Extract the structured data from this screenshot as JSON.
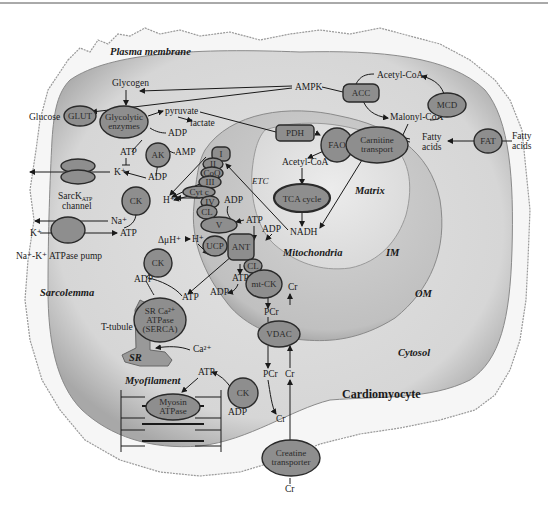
{
  "diagram": {
    "regions": {
      "plasma_membrane": "Plasma membrane",
      "sarcolemma": "Sarcolemma",
      "sr": "SR",
      "t_tubule": "T-tubule",
      "myofilament": "Myofilament",
      "mitochondria": "Mitochondria",
      "matrix": "Matrix",
      "im": "IM",
      "om": "OM",
      "cytosol": "Cytosol",
      "cell": "Cardiomyocyte",
      "etc": "ETC"
    },
    "enzymes": {
      "glut": "GLUT",
      "glycolytic_1": "Glycolytic",
      "glycolytic_2": "enzymes",
      "ak": "AK",
      "ck_top": "CK",
      "ck_mid": "CK",
      "ck_myo": "CK",
      "pdh": "PDH",
      "acc": "ACC",
      "mcd": "MCD",
      "fao": "FAO",
      "carnitine_1": "Carnitine",
      "carnitine_2": "transport",
      "fat": "FAT",
      "tca": "TCA cycle",
      "c1": "I",
      "c2": "II",
      "coq": "CoQ",
      "c3": "III",
      "cytc": "Cyt c",
      "c4": "IV",
      "cl1": "CL",
      "c5": "V",
      "ucp": "UCP",
      "ant": "ANT",
      "cl2": "CL",
      "mtck": "mt-CK",
      "vdac": "VDAC",
      "serca_1": "SR Ca²⁺",
      "serca_2": "ATPase",
      "serca_3": "(SERCA)",
      "myosin_1": "Myosin",
      "myosin_2": "ATPase",
      "creatine_1": "Creatine",
      "creatine_2": "transporter",
      "sarc_katp_1": "SarcK",
      "sarc_katp_sub": "ATP",
      "sarc_katp_2": "channel",
      "nak_pump": "Na⁺-K⁺ ATPase pump"
    },
    "metabolites": {
      "glycogen": "Glycogen",
      "glucose": "Glucose",
      "pyruvate": "pyruvate",
      "lactate": "lactate",
      "ampk": "AMPK",
      "acetyl_coa_top": "Acetyl-CoA",
      "malonyl_coa": "Malonyl-CoA",
      "fatty_acids_in": "Fatty\nacids",
      "fatty_acids_in_1": "Fatty",
      "fatty_acids_in_2": "acids",
      "fatty_acids_out_1": "Fatty",
      "fatty_acids_out_2": "acids",
      "acetyl_coa_mito": "Acetyl-CoA",
      "nadh": "NADH",
      "adp_glyco": "ADP",
      "atp_ak": "ATP",
      "amp": "AMP",
      "adp_ak": "ADP",
      "k_in": "K⁺",
      "h_plus_1": "H⁺",
      "na": "Na⁺",
      "k_out": "K⁺",
      "atp_pump": "ATP",
      "delta_mu_h": "ΔμH⁺",
      "h_plus_2": "H⁺",
      "adp_v": "ADP",
      "atp_v": "ATP",
      "adp_ant": "ADP",
      "atp_ant": "ATP",
      "adp_ant2": "ADP",
      "adp_serca": "ADP",
      "atp_serca": "ATP",
      "ca": "Ca²⁺",
      "cr_mtck": "Cr",
      "pcr_1": "PCr",
      "pcr_2": "PCr",
      "cr_2": "Cr",
      "cr_3": "Cr",
      "cr_bottom": "Cr",
      "atp_myo": "ATP",
      "adp_myo": "ADP"
    },
    "colors": {
      "membrane_outer": "#f4f4f4",
      "cytosol": "#dadada",
      "mito_outer": "#c8c8c8",
      "mito_matrix": "#e4e4e4",
      "enzyme_fill": "#8e8e8e",
      "enzyme_stroke": "#2a2a2a"
    }
  }
}
